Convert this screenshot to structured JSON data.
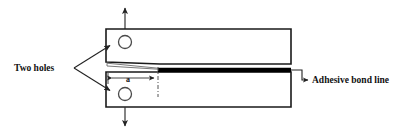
{
  "figure": {
    "title_visible": false,
    "type": "dcb-specimen-schematic",
    "background_color": "#ffffff",
    "line_color": "#1a1a1a",
    "bondline_color": "#000000"
  },
  "labels": {
    "two_holes": "Two holes",
    "adhesive_bond_line": "Adhesive bond line",
    "crack_length_symbol": "a"
  },
  "annotations": {
    "load_arrow_up": "load-arrow-up",
    "load_arrow_down": "load-arrow-down",
    "crack_tip_marker": "crack-tip-centerline"
  },
  "geometry": {
    "upper_beam": {
      "x": 106,
      "y": 29,
      "width": 185,
      "height": 35
    },
    "lower_beam": {
      "x": 106,
      "y": 72,
      "width": 185,
      "height": 35
    },
    "upper_hole": {
      "cx": 125,
      "cy": 42,
      "r": 6.5
    },
    "lower_hole": {
      "cx": 125,
      "cy": 94,
      "r": 6.5
    },
    "bond_line": {
      "x1": 158,
      "x2": 291,
      "y": 70
    },
    "crack_tip_x": 158,
    "dimension_line": {
      "x1": 108,
      "x2": 158,
      "y": 78
    }
  }
}
